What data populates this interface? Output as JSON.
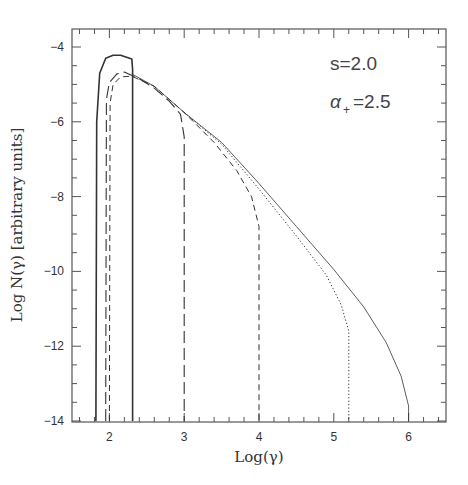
{
  "chart_data": {
    "type": "line",
    "title": "",
    "xlabel": "Log(γ)",
    "ylabel": "Log N(γ) [arbitrary units]",
    "xlim": [
      1.5,
      6.5
    ],
    "ylim": [
      -14,
      -3.5
    ],
    "x_ticks": [
      2,
      3,
      4,
      5,
      6
    ],
    "x_tick_labels": [
      "2",
      "3",
      "4",
      "5",
      "6"
    ],
    "y_ticks": [
      -4,
      -6,
      -8,
      -10,
      -12,
      -14
    ],
    "y_tick_labels": [
      "-4",
      "-6",
      "-8",
      "-10",
      "-12",
      "-14"
    ],
    "grid": false,
    "legend": null,
    "annotations": [
      {
        "text": "s=2.0",
        "x": 5.1,
        "y": -4.3
      },
      {
        "text": "α₊=2.5",
        "x": 5.1,
        "y": -5.3
      }
    ],
    "series": [
      {
        "name": "solid-narrow",
        "style": "solid",
        "x": [
          1.82,
          1.83,
          1.87,
          1.95,
          2.05,
          2.15,
          2.3,
          2.31,
          2.31
        ],
        "y": [
          -14,
          -6.0,
          -4.7,
          -4.3,
          -4.22,
          -4.22,
          -4.32,
          -4.6,
          -14
        ]
      },
      {
        "name": "long-dash cutoff 3",
        "style": "longdash",
        "x": [
          1.95,
          1.96,
          2.0,
          2.1,
          2.2,
          2.4,
          2.6,
          2.8,
          2.95,
          3.0,
          3.0
        ],
        "y": [
          -14,
          -5.4,
          -4.95,
          -4.72,
          -4.67,
          -4.85,
          -5.1,
          -5.45,
          -5.8,
          -6.4,
          -14
        ]
      },
      {
        "name": "short-dash cutoff 4",
        "style": "shortdash",
        "x": [
          2.0,
          2.01,
          2.05,
          2.15,
          2.3,
          2.6,
          3.0,
          3.4,
          3.7,
          3.9,
          4.0,
          4.0
        ],
        "y": [
          -14,
          -5.5,
          -5.0,
          -4.8,
          -4.78,
          -5.05,
          -5.75,
          -6.55,
          -7.3,
          -8.0,
          -8.8,
          -14
        ]
      },
      {
        "name": "dotted cutoff 5.2",
        "style": "dotted",
        "x": [
          3.0,
          3.5,
          4.0,
          4.5,
          4.9,
          5.1,
          5.2,
          5.2
        ],
        "y": [
          -5.75,
          -6.6,
          -7.8,
          -9.05,
          -10.1,
          -10.9,
          -11.6,
          -14
        ]
      },
      {
        "name": "solid-thin cutoff 6",
        "style": "thin-solid",
        "x": [
          2.3,
          2.6,
          3.0,
          3.5,
          4.0,
          4.5,
          5.0,
          5.4,
          5.7,
          5.9,
          6.0,
          6.0
        ],
        "y": [
          -4.72,
          -5.05,
          -5.75,
          -6.55,
          -7.65,
          -8.8,
          -9.95,
          -10.95,
          -11.9,
          -12.8,
          -13.6,
          -14
        ]
      }
    ]
  }
}
